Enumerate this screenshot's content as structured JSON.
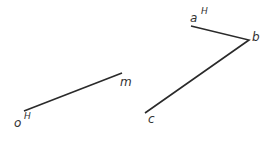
{
  "diagram": {
    "left_line": {
      "start_label": "o",
      "start_superscript": "H",
      "end_label": "m"
    },
    "right_polyline": {
      "a_label": "a",
      "a_superscript": "H",
      "b_label": "b",
      "c_label": "c"
    },
    "colors": {
      "line": "#2a2a2a",
      "text": "#333333"
    }
  }
}
